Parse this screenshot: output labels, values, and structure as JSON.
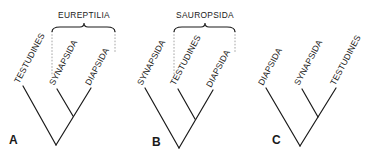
{
  "figure": {
    "colors": {
      "ink": "#1a1a1a",
      "dashed_guides": "#9a9a9a",
      "background": "#ffffff"
    }
  },
  "trees": [
    {
      "panel_label": "A",
      "taxa": [
        "TESTUDINES",
        "SYNAPSIDA",
        "DIAPSIDA"
      ],
      "topology": "(TESTUDINES,(SYNAPSIDA,DIAPSIDA))",
      "group_label": "EUREPTILIA",
      "group_members": [
        "SYNAPSIDA",
        "DIAPSIDA"
      ]
    },
    {
      "panel_label": "B",
      "taxa": [
        "SYNAPSIDA",
        "TESTUDINES",
        "DIAPSIDA"
      ],
      "topology": "(SYNAPSIDA,(TESTUDINES,DIAPSIDA))",
      "group_label": "SAUROPSIDA",
      "group_members": [
        "TESTUDINES",
        "DIAPSIDA"
      ]
    },
    {
      "panel_label": "C",
      "taxa": [
        "DIAPSIDA",
        "SYNAPSIDA",
        "TESTUDINES"
      ],
      "topology": "(DIAPSIDA,(SYNAPSIDA,TESTUDINES))",
      "group_label": null,
      "group_members": []
    }
  ]
}
